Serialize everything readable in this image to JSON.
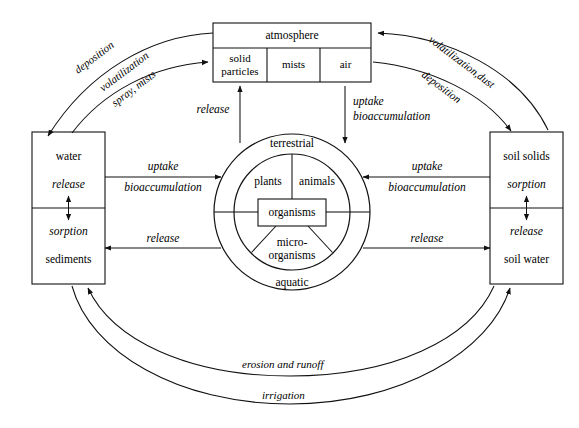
{
  "diagram": {
    "compartments": {
      "atmosphere": {
        "label": "atmosphere",
        "cells": [
          {
            "label": "solid particles",
            "line1": "solid",
            "line2": "particles"
          },
          {
            "label": "mists"
          },
          {
            "label": "air"
          }
        ]
      },
      "water_left": {
        "top_node": "water",
        "top_process": "release",
        "bottom_process": "sorption",
        "bottom_node": "sediments"
      },
      "soil_right": {
        "top_node": "soil solids",
        "top_process": "sorption",
        "bottom_process": "release",
        "bottom_node": "soil water"
      },
      "biota": {
        "outer_top": "terrestrial",
        "outer_bottom": "aquatic",
        "inner_left": "plants",
        "inner_right": "animals",
        "inner_bottom_line1": "micro-",
        "inner_bottom_line2": "organisms",
        "center": "organisms"
      }
    },
    "flows": {
      "deposition_left": "deposition",
      "volatilization_left_line1": "volatilization",
      "volatilization_left_line2": "spray, mists",
      "volatilization_right": "volatilization,dust",
      "deposition_right": "deposition",
      "release_up_center": "release",
      "uptake_down_center_line1": "uptake",
      "uptake_down_center_line2": "bioaccumulation",
      "uptake_left_line1": "uptake",
      "uptake_left_line2": "bioaccumulation",
      "release_left": "release",
      "uptake_right_line1": "uptake",
      "uptake_right_line2": "bioaccumulation",
      "release_right": "release",
      "erosion_and_runoff": "erosion and runoff",
      "irrigation": "irrigation"
    },
    "colors": {
      "stroke": "#111111",
      "background": "#ffffff",
      "text": "#000000"
    }
  }
}
